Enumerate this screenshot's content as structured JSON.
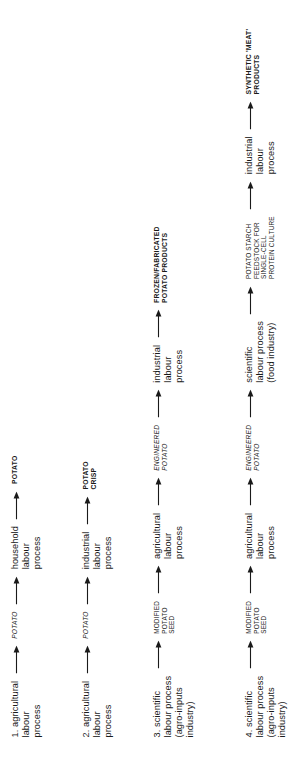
{
  "figure": {
    "type": "flow-diagram",
    "title": "",
    "orientation": "rotated-90-ccw",
    "arrow_glyph": "right-arrow",
    "background_color": "#ffffff",
    "text_color": "#1a1a1a",
    "chains": [
      {
        "number": "1.",
        "steps": [
          {
            "kind": "process",
            "lines": [
              "1. agricultural",
              "labour",
              "process"
            ]
          },
          {
            "kind": "arrow"
          },
          {
            "kind": "good",
            "lines": [
              "POTATO"
            ]
          },
          {
            "kind": "arrow"
          },
          {
            "kind": "process",
            "lines": [
              "household",
              "labour",
              "process"
            ]
          },
          {
            "kind": "arrow"
          },
          {
            "kind": "product",
            "lines": [
              "POTATO"
            ]
          }
        ]
      },
      {
        "number": "2.",
        "steps": [
          {
            "kind": "process",
            "lines": [
              "2. agricultural",
              "labour",
              "process"
            ]
          },
          {
            "kind": "arrow"
          },
          {
            "kind": "good",
            "lines": [
              "POTATO"
            ]
          },
          {
            "kind": "arrow"
          },
          {
            "kind": "process",
            "lines": [
              "industrial",
              "labour",
              "process"
            ]
          },
          {
            "kind": "arrow"
          },
          {
            "kind": "product",
            "lines": [
              "POTATO",
              "CRISP"
            ]
          }
        ]
      },
      {
        "number": "3.",
        "steps": [
          {
            "kind": "process",
            "lines": [
              "3. scientific",
              "labour process",
              "(agro-inputs",
              "industry)"
            ]
          },
          {
            "kind": "arrow"
          },
          {
            "kind": "good-plain",
            "lines": [
              "MODIFIED",
              "POTATO",
              "SEED"
            ]
          },
          {
            "kind": "arrow"
          },
          {
            "kind": "process",
            "lines": [
              "agricultural",
              "labour",
              "process"
            ]
          },
          {
            "kind": "arrow"
          },
          {
            "kind": "good",
            "lines": [
              "ENGINEERED",
              "POTATO"
            ]
          },
          {
            "kind": "arrow"
          },
          {
            "kind": "process",
            "lines": [
              "industrial",
              "labour",
              "process"
            ]
          },
          {
            "kind": "arrow"
          },
          {
            "kind": "product",
            "lines": [
              "FROZEN/FABRICATED",
              "POTATO PRODUCTS"
            ]
          }
        ]
      },
      {
        "number": "4.",
        "steps": [
          {
            "kind": "process",
            "lines": [
              "4. scientific",
              "labour process",
              "(agro-inputs",
              "industry)"
            ]
          },
          {
            "kind": "arrow"
          },
          {
            "kind": "good-plain",
            "lines": [
              "MODIFIED",
              "POTATO",
              "SEED"
            ]
          },
          {
            "kind": "arrow"
          },
          {
            "kind": "process",
            "lines": [
              "agricultural",
              "labour",
              "process"
            ]
          },
          {
            "kind": "arrow"
          },
          {
            "kind": "good",
            "lines": [
              "ENGINEERED",
              "POTATO"
            ]
          },
          {
            "kind": "arrow"
          },
          {
            "kind": "process",
            "lines": [
              "scientific",
              "labour process",
              "(food industry)"
            ]
          },
          {
            "kind": "arrow"
          },
          {
            "kind": "good-plain",
            "lines": [
              "POTATO STARCH",
              "FEEDSTOCK FOR",
              "SINGLE-CELL",
              "PROTEIN CULTURE"
            ]
          },
          {
            "kind": "arrow"
          },
          {
            "kind": "process",
            "lines": [
              "industrial",
              "labour",
              "process"
            ]
          },
          {
            "kind": "arrow"
          },
          {
            "kind": "product",
            "lines": [
              "SYNTHETIC 'MEAT'",
              "PRODUCTS"
            ]
          }
        ]
      }
    ]
  }
}
